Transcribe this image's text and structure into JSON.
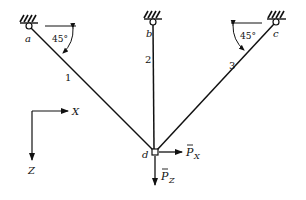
{
  "diagram": {
    "supports": [
      {
        "id": "a",
        "label": "a",
        "x": 29,
        "y": 26
      },
      {
        "id": "b",
        "label": "b",
        "x": 153,
        "y": 22
      },
      {
        "id": "c",
        "label": "c",
        "x": 276,
        "y": 22
      }
    ],
    "joint": {
      "id": "d",
      "label": "d",
      "x": 155,
      "y": 152
    },
    "members": [
      {
        "id": "1",
        "label": "1",
        "from": "a",
        "to": "d"
      },
      {
        "id": "2",
        "label": "2",
        "from": "b",
        "to": "d"
      },
      {
        "id": "3",
        "label": "3",
        "from": "c",
        "to": "d"
      }
    ],
    "angles": [
      {
        "at": "a",
        "label": "45°"
      },
      {
        "at": "c",
        "label": "45°"
      }
    ],
    "loads": [
      {
        "label": "P",
        "subscript": "X",
        "direction": "right"
      },
      {
        "label": "P",
        "subscript": "Z",
        "direction": "down"
      }
    ],
    "axes": {
      "x_label": "X",
      "z_label": "Z"
    }
  }
}
